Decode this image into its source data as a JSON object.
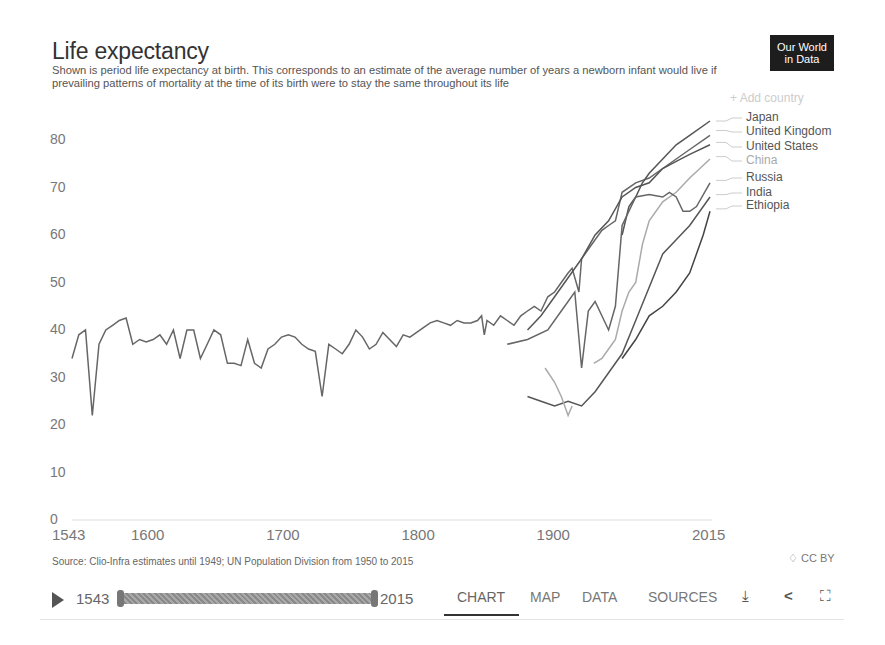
{
  "header": {
    "title": "Life expectancy",
    "subtitle": "Shown is period life expectancy at birth. This corresponds to an estimate of the average number of years a newborn infant would live if prevailing patterns of mortality at the time of its birth were to stay the same throughout its life",
    "logo_line1": "Our World",
    "logo_line2": "in Data",
    "add_country": "+ Add country"
  },
  "legend": [
    {
      "label": "Japan",
      "color": "#555555"
    },
    {
      "label": "United Kingdom",
      "color": "#666666"
    },
    {
      "label": "United States",
      "color": "#555555"
    },
    {
      "label": "China",
      "color": "#aaaaaa"
    },
    {
      "label": "Russia",
      "color": "#666666"
    },
    {
      "label": "India",
      "color": "#555555"
    },
    {
      "label": "Ethiopia",
      "color": "#444444"
    }
  ],
  "axes": {
    "y_ticks": [
      "80",
      "70",
      "60",
      "50",
      "40",
      "30",
      "20",
      "10",
      "0"
    ],
    "x_ticks": [
      "1543",
      "1600",
      "1700",
      "1800",
      "1900",
      "2015"
    ]
  },
  "footer": {
    "source": "Source: Clio-Infra estimates until 1949; UN Population Division from 1950 to 2015",
    "license": "♢ CC BY"
  },
  "controls": {
    "timeline_start": "1543",
    "timeline_end": "2015",
    "tabs": [
      "CHART",
      "MAP",
      "DATA",
      "SOURCES"
    ],
    "active_tab": "CHART",
    "download_icon": "⤓",
    "share_icon": "<",
    "fullscreen_icon": "⛶"
  },
  "chart_data": {
    "type": "line",
    "title": "Life expectancy",
    "xlabel": "",
    "ylabel": "",
    "xlim": [
      1543,
      2015
    ],
    "ylim": [
      0,
      85
    ],
    "grid": false,
    "legend_position": "right",
    "series": [
      {
        "name": "United Kingdom",
        "points": [
          [
            1543,
            34
          ],
          [
            1548,
            39
          ],
          [
            1553,
            40
          ],
          [
            1558,
            22
          ],
          [
            1563,
            37
          ],
          [
            1568,
            40
          ],
          [
            1573,
            41
          ],
          [
            1578,
            42
          ],
          [
            1583,
            42.5
          ],
          [
            1588,
            37
          ],
          [
            1593,
            38
          ],
          [
            1598,
            37.5
          ],
          [
            1603,
            38
          ],
          [
            1608,
            39
          ],
          [
            1613,
            37
          ],
          [
            1618,
            40
          ],
          [
            1623,
            34
          ],
          [
            1628,
            40
          ],
          [
            1633,
            40
          ],
          [
            1638,
            34
          ],
          [
            1643,
            37
          ],
          [
            1648,
            40
          ],
          [
            1653,
            39
          ],
          [
            1658,
            33
          ],
          [
            1663,
            33
          ],
          [
            1668,
            32.5
          ],
          [
            1673,
            38
          ],
          [
            1678,
            33
          ],
          [
            1683,
            32
          ],
          [
            1688,
            36
          ],
          [
            1693,
            37
          ],
          [
            1698,
            38.5
          ],
          [
            1703,
            39
          ],
          [
            1708,
            38.5
          ],
          [
            1713,
            37
          ],
          [
            1718,
            36
          ],
          [
            1723,
            35.5
          ],
          [
            1728,
            26
          ],
          [
            1733,
            37
          ],
          [
            1738,
            36
          ],
          [
            1743,
            35
          ],
          [
            1748,
            37
          ],
          [
            1753,
            40
          ],
          [
            1758,
            38.5
          ],
          [
            1763,
            36
          ],
          [
            1768,
            37
          ],
          [
            1773,
            39.5
          ],
          [
            1778,
            38
          ],
          [
            1783,
            36.5
          ],
          [
            1788,
            39
          ],
          [
            1793,
            38.5
          ],
          [
            1798,
            39.5
          ],
          [
            1803,
            40.5
          ],
          [
            1808,
            41.5
          ],
          [
            1813,
            42
          ],
          [
            1818,
            41.5
          ],
          [
            1823,
            41
          ],
          [
            1828,
            42
          ],
          [
            1833,
            41.5
          ],
          [
            1838,
            41.5
          ],
          [
            1843,
            42
          ],
          [
            1846,
            43
          ],
          [
            1848,
            39
          ],
          [
            1850,
            42
          ],
          [
            1855,
            41
          ],
          [
            1860,
            43
          ],
          [
            1865,
            42
          ],
          [
            1870,
            41
          ],
          [
            1875,
            43
          ],
          [
            1880,
            44
          ],
          [
            1885,
            45
          ],
          [
            1890,
            44
          ],
          [
            1895,
            47
          ],
          [
            1900,
            48
          ],
          [
            1905,
            50
          ],
          [
            1910,
            52
          ],
          [
            1913,
            53
          ],
          [
            1916,
            50
          ],
          [
            1918,
            48
          ],
          [
            1920,
            55
          ],
          [
            1925,
            57
          ],
          [
            1930,
            59
          ],
          [
            1935,
            61
          ],
          [
            1940,
            62
          ],
          [
            1945,
            63
          ],
          [
            1950,
            69
          ],
          [
            1960,
            71
          ],
          [
            1970,
            72
          ],
          [
            1980,
            74
          ],
          [
            1990,
            76
          ],
          [
            2000,
            78
          ],
          [
            2015,
            81
          ]
        ]
      },
      {
        "name": "Japan",
        "points": [
          [
            1950,
            60
          ],
          [
            1955,
            66
          ],
          [
            1960,
            68
          ],
          [
            1965,
            71
          ],
          [
            1970,
            73
          ],
          [
            1980,
            76
          ],
          [
            1990,
            79
          ],
          [
            2000,
            81
          ],
          [
            2015,
            84
          ]
        ]
      },
      {
        "name": "United States",
        "points": [
          [
            1880,
            40
          ],
          [
            1890,
            43
          ],
          [
            1900,
            47
          ],
          [
            1910,
            51
          ],
          [
            1920,
            55
          ],
          [
            1930,
            60
          ],
          [
            1940,
            63
          ],
          [
            1950,
            68
          ],
          [
            1960,
            70
          ],
          [
            1970,
            71
          ],
          [
            1980,
            74
          ],
          [
            1990,
            75.5
          ],
          [
            2000,
            77
          ],
          [
            2015,
            79
          ]
        ]
      },
      {
        "name": "China",
        "points": [
          [
            1929,
            33
          ],
          [
            1935,
            34
          ],
          [
            1940,
            36
          ],
          [
            1945,
            38
          ],
          [
            1950,
            44
          ],
          [
            1955,
            48
          ],
          [
            1960,
            50
          ],
          [
            1965,
            58
          ],
          [
            1970,
            63
          ],
          [
            1980,
            67
          ],
          [
            1990,
            69
          ],
          [
            2000,
            72
          ],
          [
            2015,
            76
          ]
        ]
      },
      {
        "name": "Russia",
        "points": [
          [
            1865,
            37
          ],
          [
            1880,
            38
          ],
          [
            1895,
            40
          ],
          [
            1905,
            44
          ],
          [
            1915,
            48
          ],
          [
            1920,
            32
          ],
          [
            1925,
            44
          ],
          [
            1930,
            46
          ],
          [
            1940,
            40
          ],
          [
            1945,
            45
          ],
          [
            1950,
            62
          ],
          [
            1960,
            68
          ],
          [
            1970,
            68.5
          ],
          [
            1980,
            68
          ],
          [
            1985,
            69
          ],
          [
            1990,
            68
          ],
          [
            1995,
            65
          ],
          [
            2000,
            65
          ],
          [
            2005,
            66
          ],
          [
            2015,
            71
          ]
        ]
      },
      {
        "name": "India",
        "points": [
          [
            1880,
            26
          ],
          [
            1890,
            25
          ],
          [
            1900,
            24
          ],
          [
            1910,
            25
          ],
          [
            1920,
            24
          ],
          [
            1930,
            27
          ],
          [
            1940,
            31
          ],
          [
            1950,
            35
          ],
          [
            1960,
            42
          ],
          [
            1970,
            49
          ],
          [
            1980,
            56
          ],
          [
            1990,
            59
          ],
          [
            2000,
            62
          ],
          [
            2015,
            68
          ]
        ]
      },
      {
        "name": "Ethiopia",
        "points": [
          [
            1950,
            34
          ],
          [
            1960,
            38
          ],
          [
            1970,
            43
          ],
          [
            1980,
            45
          ],
          [
            1990,
            48
          ],
          [
            2000,
            52
          ],
          [
            2010,
            60
          ],
          [
            2015,
            65
          ]
        ]
      },
      {
        "name": "China (early)",
        "points": [
          [
            1893,
            32
          ],
          [
            1900,
            29
          ],
          [
            1905,
            26
          ],
          [
            1910,
            22
          ],
          [
            1913,
            24
          ]
        ]
      }
    ]
  }
}
